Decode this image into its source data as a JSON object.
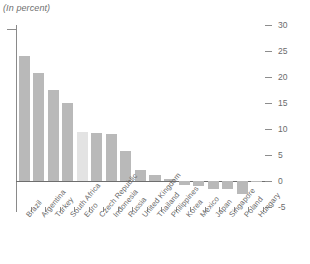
{
  "chart_data": {
    "type": "bar",
    "title": "",
    "subtitle": "",
    "unit_note": "(In percent)",
    "xlabel": "",
    "ylabel": "",
    "ylim": [
      -5,
      30
    ],
    "yticks": [
      30,
      25,
      20,
      15,
      10,
      5,
      0,
      -5
    ],
    "ytick_labels": [
      "30",
      "25",
      "20",
      "15",
      "10",
      "5",
      "0",
      "-5"
    ],
    "grid": false,
    "legend": "none",
    "zero_line": 0,
    "bar_color": "#b9b9b9",
    "highlight_color": "#e3e3e3",
    "highlight_category": "Euro",
    "categories": [
      "Brazil",
      "Argentina",
      "Turkey",
      "South Africa",
      "Euro",
      "Czech Republic",
      "Indonesia",
      "Russia",
      "United Kingdom",
      "Thailand",
      "Philippines",
      "Korea",
      "Mexico",
      "Japan",
      "Singapore",
      "Poland",
      "Hungary"
    ],
    "values": [
      24.0,
      20.7,
      17.5,
      15.0,
      9.5,
      9.3,
      9.0,
      5.8,
      2.2,
      1.2,
      0.4,
      -0.8,
      -0.9,
      -1.5,
      -1.6,
      -2.5,
      -0.1
    ]
  }
}
